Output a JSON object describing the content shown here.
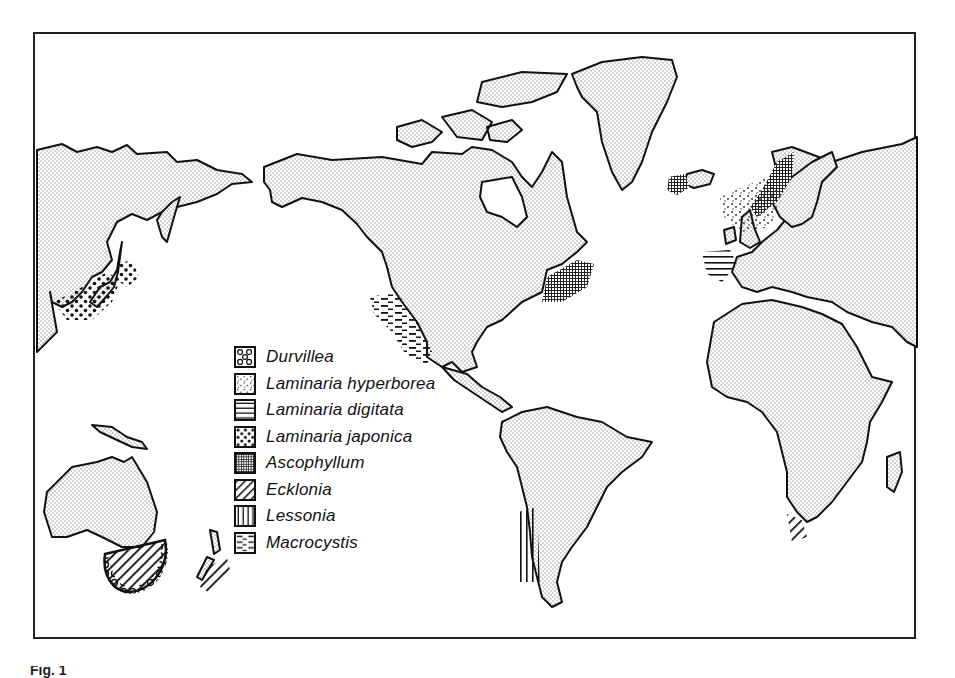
{
  "figure": {
    "caption_fragment": "Fig. 1"
  },
  "map": {
    "type": "world distribution map of kelp genera",
    "land_fill": "stippled grey",
    "regions_with_patterns": [
      {
        "region": "Japan / NW Pacific",
        "species": [
          "Laminaria japonica",
          "Laminaria hyperborea"
        ]
      },
      {
        "region": "Pacific coast of North America (Baja California)",
        "species": [
          "Macrocystis"
        ]
      },
      {
        "region": "NW Atlantic (Gulf of Maine / Nova Scotia)",
        "species": [
          "Ascophyllum"
        ]
      },
      {
        "region": "Iceland",
        "species": [
          "Ascophyllum"
        ]
      },
      {
        "region": "Norway / North Sea",
        "species": [
          "Laminaria hyperborea",
          "Ascophyllum"
        ]
      },
      {
        "region": "Iberian Atlantic coast",
        "species": [
          "Laminaria digitata"
        ]
      },
      {
        "region": "Chile",
        "species": [
          "Lessonia",
          "Durvillea"
        ]
      },
      {
        "region": "South Africa",
        "species": [
          "Ecklonia"
        ]
      },
      {
        "region": "Southern Australia / Tasmania",
        "species": [
          "Ecklonia",
          "Durvillea"
        ]
      },
      {
        "region": "New Zealand",
        "species": [
          "Ecklonia"
        ]
      }
    ]
  },
  "legend": {
    "items": [
      {
        "label": "Durvillea",
        "pattern": "ring-dots"
      },
      {
        "label": "Laminaria hyperborea",
        "pattern": "fine-stipple"
      },
      {
        "label": "Laminaria digitata",
        "pattern": "horizontal-lines"
      },
      {
        "label": "Laminaria japonica",
        "pattern": "large-dots"
      },
      {
        "label": "Ascophyllum",
        "pattern": "crosshatch"
      },
      {
        "label": "Ecklonia",
        "pattern": "diagonal-lines"
      },
      {
        "label": "Lessonia",
        "pattern": "vertical-lines"
      },
      {
        "label": "Macrocystis",
        "pattern": "dashes"
      }
    ]
  },
  "colors": {
    "ink": "#111111",
    "land": "#d8d8d8",
    "background": "#ffffff"
  }
}
